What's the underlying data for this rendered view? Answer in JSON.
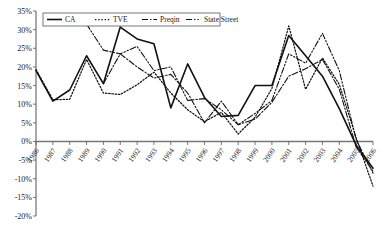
{
  "chart_data": {
    "type": "line",
    "title": "",
    "xlabel": "",
    "ylabel": "",
    "grid": false,
    "legend_position": "top-left-inside",
    "ylim": [
      -20,
      35
    ],
    "ytick_labels": [
      "35%",
      "30%",
      "25%",
      "20%",
      "15%",
      "10%",
      "5%",
      "0%",
      "-5%",
      "-10%",
      "-15%",
      "-20%"
    ],
    "ytick_values": [
      35,
      30,
      25,
      20,
      15,
      10,
      5,
      0,
      -5,
      -10,
      -15,
      -20
    ],
    "categories": [
      "1986",
      "1987",
      "1988",
      "1989",
      "1990",
      "1991",
      "1992",
      "1993",
      "1994",
      "1995",
      "1996",
      "1997",
      "1998",
      "1999",
      "2000",
      "2001",
      "2002",
      "2003",
      "2004",
      "2005",
      "2006"
    ],
    "series": [
      {
        "name": "CA",
        "style": "solid",
        "values": [
          19.0,
          10.8,
          13.8,
          23.0,
          15.5,
          30.7,
          27.5,
          26.2,
          9.0,
          20.8,
          11.8,
          6.7,
          7.0,
          15.0,
          15.0,
          28.4,
          23.0,
          17.5,
          8.8,
          -1.0,
          -7.2
        ]
      },
      {
        "name": "TVE",
        "style": "dotted",
        "values": [
          19.3,
          11.2,
          11.3,
          22.0,
          13.0,
          12.6,
          15.2,
          18.6,
          13.0,
          8.5,
          5.3,
          7.8,
          2.0,
          6.5,
          14.2,
          31.0,
          14.0,
          22.4,
          15.3,
          1.0,
          -12.0
        ]
      },
      {
        "name": "Preqin",
        "style": "dash-dot",
        "values": [
          null,
          null,
          null,
          null,
          15.5,
          23.5,
          20.0,
          17.0,
          18.0,
          13.0,
          5.0,
          10.8,
          4.5,
          6.0,
          10.5,
          17.5,
          19.5,
          22.0,
          14.0,
          -1.5,
          -8.0
        ]
      },
      {
        "name": "State Street",
        "style": "dash-dot-dot",
        "values": [
          null,
          null,
          null,
          31.5,
          24.5,
          23.5,
          25.5,
          19.0,
          20.0,
          11.0,
          11.5,
          8.5,
          4.5,
          7.5,
          11.0,
          23.5,
          21.0,
          29.0,
          19.0,
          0.5,
          -8.5
        ]
      }
    ]
  },
  "legend": {
    "items": [
      {
        "label": "CA"
      },
      {
        "label": "TVE"
      },
      {
        "label": "Preqin"
      },
      {
        "label": "State Street"
      }
    ]
  }
}
